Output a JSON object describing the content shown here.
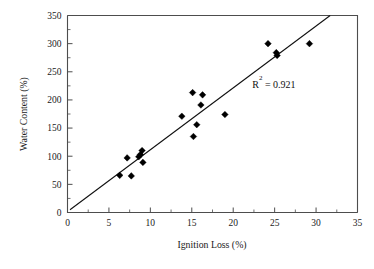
{
  "chart_data": {
    "type": "scatter",
    "title": "",
    "xlabel": "Ignition Loss (%)",
    "ylabel": "Water Content (%)",
    "xlim": [
      0,
      35
    ],
    "ylim": [
      0,
      350
    ],
    "xticks": [
      0,
      5,
      10,
      15,
      20,
      25,
      30,
      35
    ],
    "yticks": [
      0,
      50,
      100,
      150,
      200,
      250,
      300,
      350
    ],
    "xtick_labels": [
      "0",
      "5",
      "10",
      "15",
      "20",
      "25",
      "30",
      "35"
    ],
    "ytick_labels": [
      "0",
      "50",
      "100",
      "150",
      "200",
      "250",
      "300",
      "350"
    ],
    "minor_ticks_per_interval": 1,
    "grid": false,
    "legend": null,
    "marker_style": "filled-diamond",
    "marker_color": "#000000",
    "points": [
      {
        "x": 6.3,
        "y": 66
      },
      {
        "x": 7.2,
        "y": 97
      },
      {
        "x": 7.7,
        "y": 65
      },
      {
        "x": 8.6,
        "y": 99
      },
      {
        "x": 8.8,
        "y": 103
      },
      {
        "x": 9.0,
        "y": 110
      },
      {
        "x": 9.1,
        "y": 89
      },
      {
        "x": 13.8,
        "y": 171
      },
      {
        "x": 15.1,
        "y": 213
      },
      {
        "x": 15.2,
        "y": 135
      },
      {
        "x": 15.6,
        "y": 156
      },
      {
        "x": 16.3,
        "y": 209
      },
      {
        "x": 16.1,
        "y": 191
      },
      {
        "x": 19.0,
        "y": 174
      },
      {
        "x": 24.2,
        "y": 300
      },
      {
        "x": 25.2,
        "y": 284
      },
      {
        "x": 25.3,
        "y": 279
      },
      {
        "x": 29.2,
        "y": 300
      }
    ],
    "fit_line": {
      "type": "linear",
      "x_start": 0.3,
      "y_start": 5,
      "x_end": 31.7,
      "y_end": 350
    },
    "annotations": [
      {
        "name": "r-squared",
        "text_base": "R",
        "text_sup": "2",
        "text_rest": " = 0.921",
        "x": 22.3,
        "y": 222
      }
    ]
  }
}
